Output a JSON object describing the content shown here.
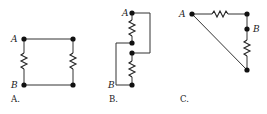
{
  "diagrams": [
    {
      "id": "A",
      "caption": "A.",
      "node_labels": {
        "top": "A",
        "bottom": "B"
      },
      "description": "Two resistors in parallel between A and B (square loop)"
    },
    {
      "id": "B",
      "caption": "B.",
      "node_labels": {
        "top": "A",
        "bottom": "B"
      },
      "description": "Two resistors arranged vertically with crossing connecting wires"
    },
    {
      "id": "C",
      "caption": "C.",
      "node_labels": {
        "left": "A",
        "right": "B"
      },
      "description": "Triangle with two resistors and a diagonal wire"
    }
  ],
  "colors": {
    "wire": "#333333",
    "node": "#111111",
    "background": "#ffffff"
  }
}
